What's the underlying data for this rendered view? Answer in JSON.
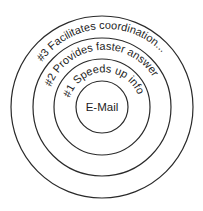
{
  "diagram": {
    "type": "concentric-circles",
    "center_label": "E-Mail",
    "rings": [
      {
        "rank": 1,
        "label": "#1 Speeds up info..."
      },
      {
        "rank": 2,
        "label": "#2 Provides faster answers"
      },
      {
        "rank": 3,
        "label": "#3 Facilitates coordination..."
      }
    ]
  }
}
